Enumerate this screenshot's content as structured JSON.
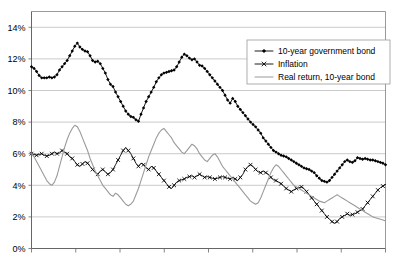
{
  "chart_data": {
    "type": "line",
    "title": "",
    "xlabel": "",
    "ylabel": "",
    "ylim": [
      0,
      15
    ],
    "xlim": [
      0,
      100
    ],
    "grid": true,
    "legend_position": "top-right",
    "y_ticks": [
      "0%",
      "2%",
      "4%",
      "6%",
      "8%",
      "10%",
      "12%",
      "14%"
    ],
    "y_tick_values": [
      0,
      2,
      4,
      6,
      8,
      10,
      12,
      14
    ],
    "x_tick_count": 9,
    "x_tick_labels": [
      "",
      "",
      "",
      "",
      "",
      "",
      "",
      "",
      ""
    ],
    "series": [
      {
        "name": "10-year government bond",
        "marker": "diamond",
        "color": "#000000",
        "values": [
          11.5,
          11.4,
          11.2,
          10.95,
          10.8,
          10.8,
          10.8,
          10.85,
          10.8,
          10.85,
          11.0,
          11.3,
          11.5,
          11.7,
          11.9,
          12.2,
          12.5,
          12.8,
          13.0,
          12.75,
          12.6,
          12.5,
          12.45,
          12.2,
          11.9,
          11.8,
          11.85,
          11.7,
          11.4,
          11.1,
          10.7,
          10.4,
          10.25,
          9.9,
          9.6,
          9.3,
          9.0,
          8.7,
          8.5,
          8.35,
          8.3,
          8.15,
          8.05,
          8.5,
          8.9,
          9.3,
          9.6,
          9.9,
          10.2,
          10.55,
          10.8,
          11.0,
          11.1,
          11.15,
          11.2,
          11.25,
          11.3,
          11.5,
          11.8,
          12.1,
          12.3,
          12.2,
          12.05,
          11.95,
          12.0,
          11.8,
          11.6,
          11.55,
          11.4,
          11.2,
          11.0,
          10.8,
          10.6,
          10.4,
          10.2,
          10.0,
          9.7,
          9.4,
          9.2,
          9.5,
          9.3,
          9.0,
          8.8,
          8.6,
          8.4,
          8.2,
          8.0,
          7.85,
          7.7,
          7.5,
          7.3,
          7.0,
          6.8,
          6.6,
          6.4,
          6.2,
          6.1,
          6.0,
          5.9,
          5.85,
          5.8,
          5.7,
          5.6,
          5.5,
          5.4,
          5.3,
          5.2,
          5.1,
          5.05,
          5.0,
          4.9,
          4.8,
          4.6,
          4.45,
          4.3,
          4.25,
          4.2,
          4.3,
          4.5,
          4.7,
          4.9,
          5.1,
          5.3,
          5.5,
          5.6,
          5.5,
          5.45,
          5.55,
          5.75,
          5.7,
          5.65,
          5.7,
          5.65,
          5.6,
          5.6,
          5.55,
          5.5,
          5.45,
          5.4,
          5.3
        ]
      },
      {
        "name": "Inflation",
        "marker": "cross",
        "color": "#000000",
        "values": [
          6.0,
          5.95,
          5.9,
          5.95,
          6.0,
          5.9,
          5.85,
          5.9,
          6.0,
          6.1,
          6.0,
          6.05,
          6.2,
          6.1,
          6.0,
          5.8,
          5.7,
          5.5,
          5.3,
          5.2,
          5.35,
          5.5,
          5.4,
          5.2,
          5.0,
          4.8,
          4.7,
          4.9,
          5.0,
          4.85,
          4.7,
          4.8,
          5.0,
          5.3,
          5.6,
          5.9,
          6.2,
          6.4,
          6.2,
          6.0,
          5.7,
          5.4,
          5.2,
          5.4,
          5.3,
          5.1,
          5.0,
          5.2,
          5.1,
          4.9,
          4.7,
          4.5,
          4.3,
          4.1,
          3.9,
          3.8,
          4.0,
          4.2,
          4.3,
          4.35,
          4.4,
          4.5,
          4.55,
          4.6,
          4.5,
          4.6,
          4.7,
          4.6,
          4.5,
          4.55,
          4.5,
          4.45,
          4.4,
          4.45,
          4.5,
          4.55,
          4.5,
          4.45,
          4.4,
          4.5,
          4.4,
          4.3,
          4.5,
          4.7,
          5.0,
          5.2,
          5.3,
          5.2,
          5.0,
          4.85,
          4.8,
          4.9,
          4.8,
          4.7,
          4.5,
          4.35,
          4.3,
          4.2,
          4.1,
          3.95,
          3.8,
          3.7,
          3.6,
          3.7,
          3.8,
          3.85,
          3.9,
          3.8,
          3.6,
          3.4,
          3.2,
          3.0,
          2.8,
          2.6,
          2.4,
          2.2,
          2.0,
          1.85,
          1.7,
          1.6,
          1.7,
          1.9,
          2.0,
          2.1,
          2.2,
          2.1,
          2.15,
          2.2,
          2.3,
          2.4,
          2.5,
          2.7,
          2.9,
          3.1,
          3.3,
          3.5,
          3.7,
          3.85,
          3.95,
          4.05
        ]
      },
      {
        "name": "Real return, 10-year bond",
        "marker": "none",
        "color": "#9a9a9a",
        "values": [
          6.0,
          5.8,
          5.5,
          5.2,
          4.9,
          4.6,
          4.3,
          4.1,
          4.0,
          4.2,
          4.6,
          5.2,
          5.8,
          6.4,
          6.9,
          7.3,
          7.6,
          7.8,
          7.7,
          7.4,
          7.0,
          6.6,
          6.2,
          5.7,
          5.3,
          4.9,
          4.6,
          4.3,
          4.0,
          3.8,
          3.6,
          3.4,
          3.3,
          3.5,
          3.4,
          3.2,
          3.0,
          2.8,
          2.7,
          2.8,
          3.0,
          3.4,
          3.8,
          4.3,
          4.8,
          5.3,
          5.8,
          6.2,
          6.6,
          7.0,
          7.3,
          7.5,
          7.6,
          7.4,
          7.2,
          7.0,
          6.7,
          6.5,
          6.3,
          6.1,
          6.0,
          6.2,
          6.4,
          6.6,
          6.5,
          6.3,
          6.0,
          5.8,
          5.6,
          5.5,
          5.7,
          5.9,
          6.0,
          5.8,
          5.5,
          5.2,
          5.0,
          4.8,
          4.6,
          4.4,
          4.2,
          4.0,
          3.8,
          3.6,
          3.4,
          3.2,
          3.0,
          2.9,
          2.8,
          2.9,
          3.2,
          3.6,
          4.0,
          4.4,
          4.8,
          5.1,
          5.3,
          5.2,
          5.0,
          4.8,
          4.6,
          4.4,
          4.2,
          4.0,
          3.9,
          3.8,
          3.7,
          3.6,
          3.5,
          3.4,
          3.3,
          3.2,
          3.1,
          3.0,
          2.95,
          2.9,
          3.0,
          3.1,
          3.2,
          3.3,
          3.4,
          3.3,
          3.2,
          3.1,
          3.0,
          2.9,
          2.8,
          2.7,
          2.6,
          2.5,
          2.4,
          2.3,
          2.2,
          2.1,
          2.0,
          1.95,
          1.9,
          1.85,
          1.8,
          1.75
        ]
      }
    ]
  },
  "legend": {
    "items": [
      {
        "label": "10-year government bond"
      },
      {
        "label": "Inflation"
      },
      {
        "label": "Real return, 10-year bond"
      }
    ]
  }
}
